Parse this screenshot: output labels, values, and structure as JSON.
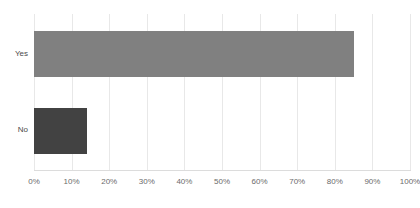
{
  "chart_data": {
    "type": "bar",
    "orientation": "horizontal",
    "title": "",
    "subtitle": "",
    "xlabel": "",
    "ylabel": "",
    "categories": [
      "Yes",
      "No"
    ],
    "values": [
      85,
      14
    ],
    "value_labels": [
      "85%",
      "14%"
    ],
    "xlim": [
      0,
      100
    ],
    "xticks": [
      0,
      10,
      20,
      30,
      40,
      50,
      60,
      70,
      80,
      90,
      100
    ],
    "xtick_labels": [
      "0%",
      "10%",
      "20%",
      "30%",
      "40%",
      "50%",
      "60%",
      "70%",
      "80%",
      "90%",
      "100%"
    ],
    "grid": true,
    "grid_axis": "x",
    "legend": false,
    "legend_position": "none",
    "bar_colors": [
      "#808080",
      "#424242"
    ],
    "series": [
      {
        "name": "Response share",
        "values": [
          85,
          14
        ]
      }
    ]
  },
  "style": {
    "background_color": "#ffffff",
    "gridline_color": "#e8e8e8",
    "axis_line_color": "#dcdcdc",
    "tick_label_color": "#6b6b6b",
    "category_label_color": "#4a4a4a"
  }
}
